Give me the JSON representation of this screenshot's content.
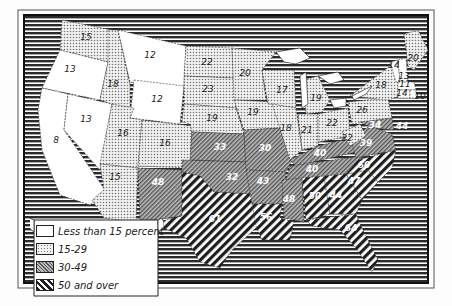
{
  "map": {
    "title": "",
    "colors": {
      "background": "#fdfdfd",
      "frame": "#222222",
      "ocean_stripes": "#333333",
      "low": "#ffffff",
      "mid_dots": "#cfcfcf",
      "high_hatch": "#8a8a8a",
      "highest_hatch": "#2a2a2a"
    },
    "legend": {
      "items": [
        {
          "label": "Less than 15 percent",
          "category": "lt15"
        },
        {
          "label": "15-29",
          "category": "15to29"
        },
        {
          "label": "30-49",
          "category": "30to49"
        },
        {
          "label": "50 and over",
          "category": "50plus"
        }
      ]
    },
    "states": [
      {
        "state": "Washington",
        "value": "15",
        "x": 86,
        "y": 40,
        "cat": "15to29"
      },
      {
        "state": "Oregon",
        "value": "13",
        "x": 70,
        "y": 72,
        "cat": "lt15"
      },
      {
        "state": "California",
        "value": "8",
        "x": 56,
        "y": 143,
        "cat": "lt15"
      },
      {
        "state": "Idaho",
        "value": "18",
        "x": 113,
        "y": 87,
        "cat": "15to29"
      },
      {
        "state": "Nevada",
        "value": "13",
        "x": 86,
        "y": 122,
        "cat": "lt15"
      },
      {
        "state": "Montana",
        "value": "12",
        "x": 150,
        "y": 58,
        "cat": "lt15"
      },
      {
        "state": "Wyoming",
        "value": "12",
        "x": 157,
        "y": 102,
        "cat": "lt15"
      },
      {
        "state": "Utah",
        "value": "16",
        "x": 123,
        "y": 136,
        "cat": "15to29"
      },
      {
        "state": "Colorado",
        "value": "16",
        "x": 165,
        "y": 146,
        "cat": "15to29"
      },
      {
        "state": "Arizona",
        "value": "15",
        "x": 115,
        "y": 180,
        "cat": "15to29"
      },
      {
        "state": "New Mexico",
        "value": "48",
        "x": 158,
        "y": 185,
        "cat": "30to49"
      },
      {
        "state": "North Dakota",
        "value": "22",
        "x": 207,
        "y": 65,
        "cat": "15to29"
      },
      {
        "state": "South Dakota",
        "value": "23",
        "x": 208,
        "y": 92,
        "cat": "15to29"
      },
      {
        "state": "Nebraska",
        "value": "19",
        "x": 212,
        "y": 121,
        "cat": "15to29"
      },
      {
        "state": "Kansas",
        "value": "33",
        "x": 220,
        "y": 150,
        "cat": "30to49"
      },
      {
        "state": "Oklahoma",
        "value": "32",
        "x": 232,
        "y": 180,
        "cat": "30to49"
      },
      {
        "state": "Texas",
        "value": "61",
        "x": 215,
        "y": 222,
        "cat": "50plus"
      },
      {
        "state": "Minnesota",
        "value": "20",
        "x": 245,
        "y": 76,
        "cat": "15to29"
      },
      {
        "state": "Iowa",
        "value": "19",
        "x": 253,
        "y": 115,
        "cat": "15to29"
      },
      {
        "state": "Missouri",
        "value": "30",
        "x": 265,
        "y": 151,
        "cat": "30to49"
      },
      {
        "state": "Arkansas",
        "value": "43",
        "x": 263,
        "y": 184,
        "cat": "30to49"
      },
      {
        "state": "Louisiana",
        "value": "56",
        "x": 266,
        "y": 220,
        "cat": "50plus"
      },
      {
        "state": "Wisconsin",
        "value": "17",
        "x": 282,
        "y": 93,
        "cat": "15to29"
      },
      {
        "state": "Illinois",
        "value": "18",
        "x": 286,
        "y": 131,
        "cat": "15to29"
      },
      {
        "state": "Michigan",
        "value": "19",
        "x": 316,
        "y": 101,
        "cat": "15to29"
      },
      {
        "state": "Indiana",
        "value": "21",
        "x": 307,
        "y": 133,
        "cat": "15to29"
      },
      {
        "state": "Ohio",
        "value": "22",
        "x": 332,
        "y": 126,
        "cat": "15to29"
      },
      {
        "state": "Kentucky",
        "value": "40",
        "x": 320,
        "y": 156,
        "cat": "30to49"
      },
      {
        "state": "Tennessee",
        "value": "40",
        "x": 312,
        "y": 172,
        "cat": "30to49"
      },
      {
        "state": "Mississippi",
        "value": "48",
        "x": 289,
        "y": 202,
        "cat": "30to49"
      },
      {
        "state": "Alabama",
        "value": "50",
        "x": 315,
        "y": 199,
        "cat": "50plus"
      },
      {
        "state": "Georgia",
        "value": "44",
        "x": 336,
        "y": 198,
        "cat": "50plus"
      },
      {
        "state": "Florida",
        "value": "64",
        "x": 351,
        "y": 231,
        "cat": "50plus"
      },
      {
        "state": "South Carolina",
        "value": "47",
        "x": 354,
        "y": 184,
        "cat": "50plus"
      },
      {
        "state": "North Carolina",
        "value": "60",
        "x": 364,
        "y": 168,
        "cat": "50plus"
      },
      {
        "state": "Virginia",
        "value": "39",
        "x": 366,
        "y": 146,
        "cat": "30to49"
      },
      {
        "state": "West Virginia",
        "value": "22",
        "x": 347,
        "y": 141,
        "cat": "15to29"
      },
      {
        "state": "Pennsylvania",
        "value": "26",
        "x": 362,
        "y": 113,
        "cat": "15to29"
      },
      {
        "state": "Maryland",
        "value": "34",
        "x": 375,
        "y": 128,
        "cat": "30to49"
      },
      {
        "state": "Delaware",
        "value": "44",
        "x": 402,
        "y": 129,
        "cat": "30to49"
      },
      {
        "state": "New York",
        "value": "18",
        "x": 381,
        "y": 88,
        "cat": "15to29"
      },
      {
        "state": "Vermont",
        "value": "14",
        "x": 394,
        "y": 68,
        "cat": "lt15"
      },
      {
        "state": "New Hampshire",
        "value": "13",
        "x": 404,
        "y": 79,
        "cat": "lt15"
      },
      {
        "state": "Maine",
        "value": "20",
        "x": 413,
        "y": 61,
        "cat": "15to29"
      },
      {
        "state": "Massachusetts",
        "value": "11",
        "x": 405,
        "y": 87,
        "cat": "lt15"
      },
      {
        "state": "Connecticut",
        "value": "14",
        "x": 402,
        "y": 96,
        "cat": "lt15"
      },
      {
        "state": "Rhode Island",
        "value": "10",
        "x": 420,
        "y": 99,
        "cat": "lt15"
      }
    ]
  },
  "chart_data": {
    "type": "map",
    "title": "",
    "legend": [
      "Less than 15 percent",
      "15-29",
      "30-49",
      "50 and over"
    ],
    "regions": [
      {
        "name": "Washington",
        "value": 15
      },
      {
        "name": "Oregon",
        "value": 13
      },
      {
        "name": "California",
        "value": 8
      },
      {
        "name": "Idaho",
        "value": 18
      },
      {
        "name": "Nevada",
        "value": 13
      },
      {
        "name": "Montana",
        "value": 12
      },
      {
        "name": "Wyoming",
        "value": 12
      },
      {
        "name": "Utah",
        "value": 16
      },
      {
        "name": "Colorado",
        "value": 16
      },
      {
        "name": "Arizona",
        "value": 15
      },
      {
        "name": "New Mexico",
        "value": 48
      },
      {
        "name": "North Dakota",
        "value": 22
      },
      {
        "name": "South Dakota",
        "value": 23
      },
      {
        "name": "Nebraska",
        "value": 19
      },
      {
        "name": "Kansas",
        "value": 33
      },
      {
        "name": "Oklahoma",
        "value": 32
      },
      {
        "name": "Texas",
        "value": 61
      },
      {
        "name": "Minnesota",
        "value": 20
      },
      {
        "name": "Iowa",
        "value": 19
      },
      {
        "name": "Missouri",
        "value": 30
      },
      {
        "name": "Arkansas",
        "value": 43
      },
      {
        "name": "Louisiana",
        "value": 56
      },
      {
        "name": "Wisconsin",
        "value": 17
      },
      {
        "name": "Illinois",
        "value": 18
      },
      {
        "name": "Michigan",
        "value": 19
      },
      {
        "name": "Indiana",
        "value": 21
      },
      {
        "name": "Ohio",
        "value": 22
      },
      {
        "name": "Kentucky",
        "value": 40
      },
      {
        "name": "Tennessee",
        "value": 40
      },
      {
        "name": "Mississippi",
        "value": 48
      },
      {
        "name": "Alabama",
        "value": 50
      },
      {
        "name": "Georgia",
        "value": 44
      },
      {
        "name": "Florida",
        "value": 64
      },
      {
        "name": "South Carolina",
        "value": 47
      },
      {
        "name": "North Carolina",
        "value": 60
      },
      {
        "name": "Virginia",
        "value": 39
      },
      {
        "name": "West Virginia",
        "value": 22
      },
      {
        "name": "Pennsylvania",
        "value": 26
      },
      {
        "name": "Maryland",
        "value": 34
      },
      {
        "name": "Delaware",
        "value": 44
      },
      {
        "name": "New York",
        "value": 18
      },
      {
        "name": "Vermont",
        "value": 14
      },
      {
        "name": "New Hampshire",
        "value": 13
      },
      {
        "name": "Maine",
        "value": 20
      },
      {
        "name": "Massachusetts",
        "value": 11
      },
      {
        "name": "Connecticut",
        "value": 14
      },
      {
        "name": "Rhode Island",
        "value": 10
      }
    ]
  }
}
